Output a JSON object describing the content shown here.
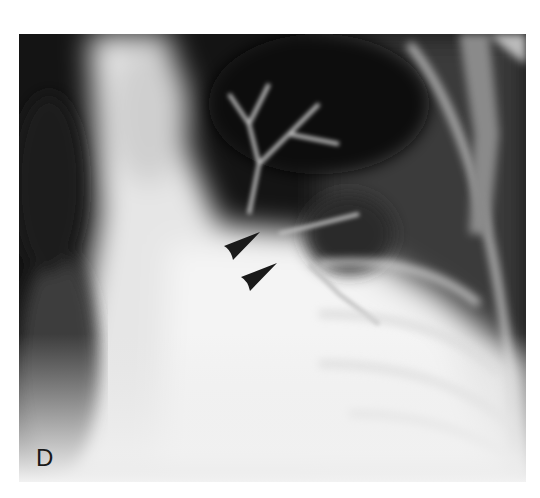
{
  "figure": {
    "panel_label": "D",
    "annotations": [
      {
        "type": "arrowhead",
        "name": "upper-arrowhead",
        "color": "#1a1a1a"
      },
      {
        "type": "arrowhead",
        "name": "lower-arrowhead",
        "color": "#1a1a1a"
      }
    ]
  }
}
